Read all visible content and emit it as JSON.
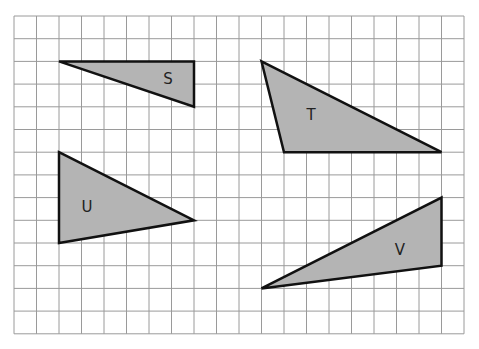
{
  "grid": {
    "origin_x": 14,
    "origin_y": 16,
    "cols": 20,
    "rows": 14,
    "cell_w": 22.5,
    "cell_h": 22.7,
    "line_color": "#9a9a9a"
  },
  "shape_style": {
    "fill": "#b4b4b4",
    "stroke": "#111111"
  },
  "shapes": [
    {
      "label": "S",
      "vertices": [
        [
          2,
          2
        ],
        [
          8,
          2
        ],
        [
          8,
          4
        ]
      ],
      "label_pos": [
        168,
        84
      ]
    },
    {
      "label": "T",
      "vertices": [
        [
          11,
          2
        ],
        [
          19,
          6
        ],
        [
          12,
          6
        ]
      ],
      "label_pos": [
        311,
        120
      ]
    },
    {
      "label": "U",
      "vertices": [
        [
          2,
          6
        ],
        [
          8,
          9
        ],
        [
          2,
          10
        ]
      ],
      "label_pos": [
        87,
        212
      ]
    },
    {
      "label": "V",
      "vertices": [
        [
          11,
          12
        ],
        [
          19,
          8
        ],
        [
          19,
          11
        ]
      ],
      "label_pos": [
        400,
        255
      ]
    }
  ]
}
